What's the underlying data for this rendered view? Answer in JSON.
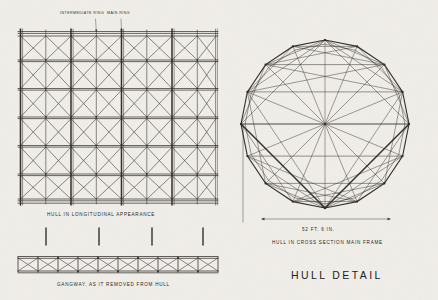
{
  "sheet": {
    "title": "HULL DETAIL",
    "background_color": "#f2f0ec",
    "ink_color": "#2a2724"
  },
  "annotations": {
    "intermediate_ring": "INTERMEDIATE RING",
    "main_ring": "MAIN RING"
  },
  "captions": {
    "longitudinal": "HULL IN LONGITUDINAL APPEARANCE",
    "gangway": "GANGWAY, AS IT REMOVED FROM HULL",
    "cross_section": "HULL IN CROSS SECTION MAIN FRAME",
    "diameter_dimension": "52 FT. 6 IN."
  },
  "views": {
    "longitudinal": {
      "name": "hull-longitudinal-elevation",
      "bays": 4,
      "main_rings": 4,
      "intermediate_rings": 4,
      "longitudinal_chords": 6
    },
    "cross_section": {
      "name": "hull-cross-section-main-frame",
      "sides": 16,
      "radius_px": 84,
      "center_x": 325,
      "center_y": 124
    },
    "gangway": {
      "name": "gangway-girder-detail",
      "bays": 10,
      "hangers": 4
    }
  }
}
